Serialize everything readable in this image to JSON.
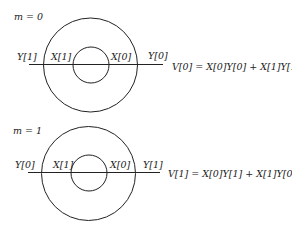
{
  "diagrams": [
    {
      "m_label": "m = 0",
      "labels": {
        "left_outer": "Y[1]",
        "left_inner": "X[1]",
        "right_inner": "X[0]",
        "right_outer": "Y[0]"
      },
      "equation": "V[0] = X[0]Y[0] + X[1]Y[1]",
      "geometry": {
        "cx": 90.5,
        "cy": 65,
        "outer_r": 47,
        "inner_r": 18,
        "line_y": 64,
        "line_x1": 29,
        "line_x2": 163
      }
    },
    {
      "m_label": "m = 1",
      "labels": {
        "left_outer": "Y[0]",
        "left_inner": "X[1]",
        "right_inner": "X[0]",
        "right_outer": "Y[1]"
      },
      "equation": "V[1] = X[0]Y[1] + X[1]Y[0]",
      "geometry": {
        "cx": 88.5,
        "cy": 173.5,
        "outer_r": 47,
        "inner_r": 18,
        "line_y": 172,
        "line_x1": 28,
        "line_x2": 160
      }
    }
  ],
  "colors": {
    "stroke": "#222222",
    "background": "#ffffff"
  }
}
